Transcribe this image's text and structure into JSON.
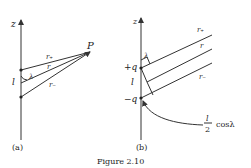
{
  "figure": {
    "caption": "Figure 2.10",
    "panel_a": {
      "tag": "(a)",
      "axis_label": "z",
      "point_label": "P",
      "separation_label": "l",
      "angle_label": "λ",
      "distance_labels": {
        "r_plus": "r₊",
        "r": "r",
        "r_minus": "r₋"
      }
    },
    "panel_b": {
      "tag": "(b)",
      "axis_label": "z",
      "charge_plus": "+q",
      "charge_minus": "−q",
      "separation_label": "l",
      "angle_label": "λ",
      "distance_labels": {
        "r_plus": "r₊",
        "r": "r",
        "r_minus": "r₋"
      },
      "annotation": {
        "numerator": "l",
        "denominator": "2",
        "suffix": "cosλ"
      }
    }
  }
}
